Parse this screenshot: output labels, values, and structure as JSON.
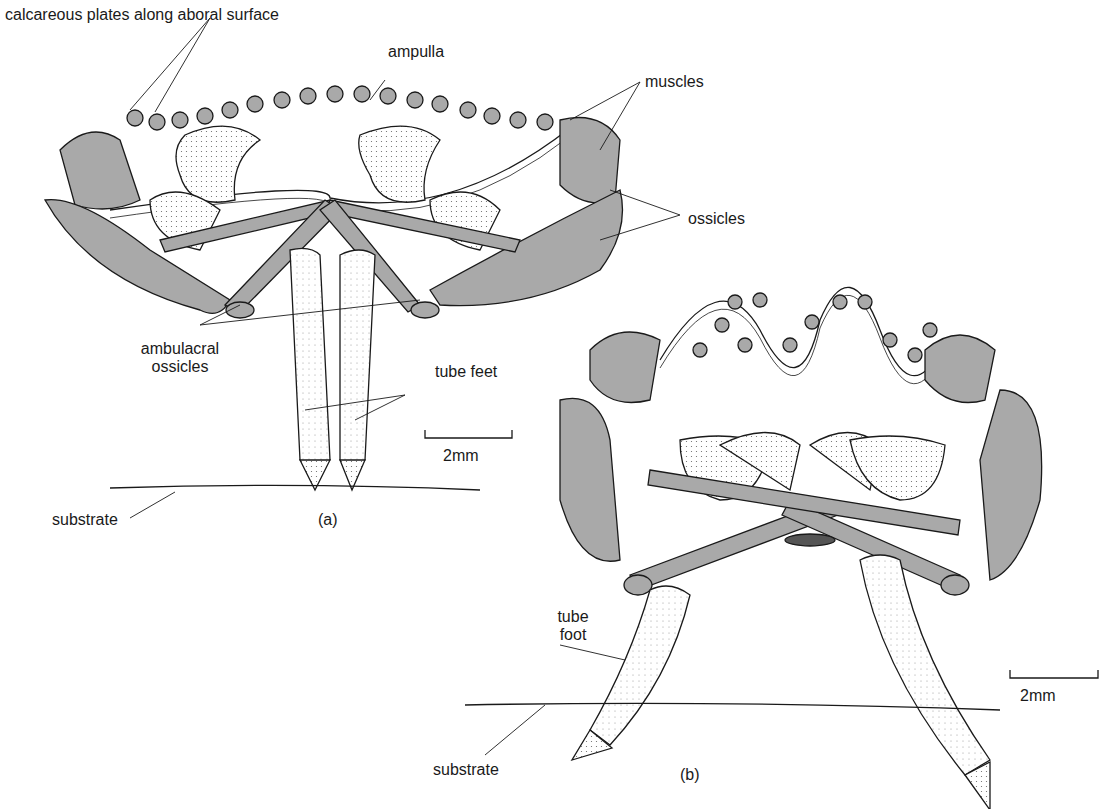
{
  "figure": {
    "panel_a": {
      "caption": "(a)",
      "labels": {
        "calcareous_plates": "calcareous plates along aboral surface",
        "ampulla": "ampulla",
        "muscles": "muscles",
        "ossicles": "ossicles",
        "ambulacral_ossicles_line1": "ambulacral",
        "ambulacral_ossicles_line2": "ossicles",
        "tube_feet": "tube feet",
        "substrate": "substrate"
      },
      "scale_bar": "2mm"
    },
    "panel_b": {
      "caption": "(b)",
      "labels": {
        "tube_foot_line1": "tube",
        "tube_foot_line2": "foot",
        "substrate": "substrate"
      },
      "scale_bar": "2mm"
    },
    "colors": {
      "ink": "#1a1a1a",
      "stipple_fill": "#a9a9a9",
      "light_fill": "#f1f1f1"
    }
  }
}
